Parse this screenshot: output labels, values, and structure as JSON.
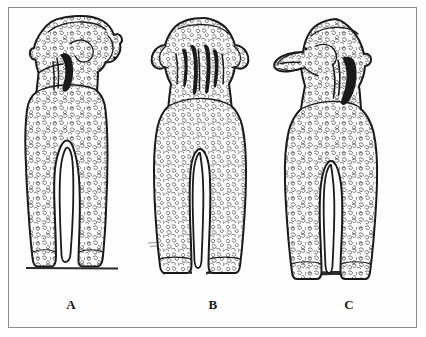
{
  "figure": {
    "background_color": "#fefefe",
    "frame_color": "#8d8d8d",
    "ink_color": "#1a1a1a",
    "fur_color": "#3a3a3a",
    "shadow_color": "#2b2b2b",
    "panels": [
      {
        "id": "a",
        "label": "A",
        "view": "rear three-quarter, head turned to the dog's right",
        "subject": "curly-coated poodle-type dog standing",
        "features": [
          "curly coat texture",
          "raised tail",
          "drop ears",
          "straight hind legs",
          "ground shadow line"
        ]
      },
      {
        "id": "b",
        "label": "B",
        "view": "straight rear view",
        "subject": "curly-coated poodle-type dog standing",
        "features": [
          "curly coat texture",
          "dark hair strands down the nape",
          "wide head with drop ears",
          "straight hind legs",
          "ground shadow"
        ]
      },
      {
        "id": "c",
        "label": "C",
        "view": "rear view, head turned in left profile",
        "subject": "curly-coated poodle-type dog standing",
        "features": [
          "curly coat texture",
          "raised curled tail",
          "muzzle in profile",
          "hind legs close together",
          "ground shadow"
        ]
      }
    ],
    "labels": {
      "a": "A",
      "b": "B",
      "c": "C"
    }
  }
}
